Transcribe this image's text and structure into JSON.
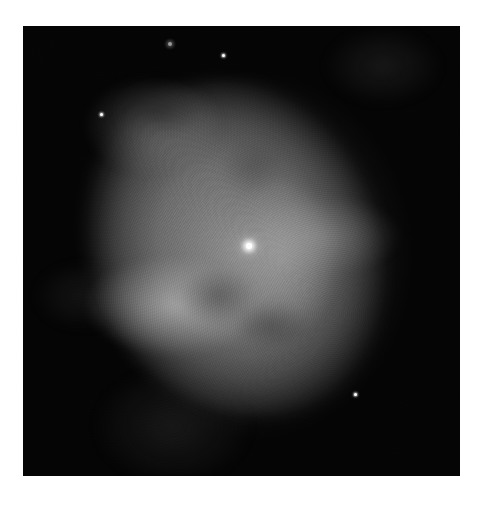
{
  "image": {
    "subject": "planetary nebula",
    "style": "grayscale astronomical photograph",
    "background_color": "#ffffff",
    "sky_color": "#050505",
    "frame": {
      "x": 23,
      "y": 26,
      "width": 437,
      "height": 450
    }
  },
  "stars": [
    {
      "name": "central-star",
      "x": 249,
      "y": 246,
      "type": "central"
    },
    {
      "name": "star-top-bright",
      "x": 223,
      "y": 55,
      "type": "small"
    },
    {
      "name": "star-top-faint",
      "x": 170,
      "y": 44,
      "type": "faint"
    },
    {
      "name": "star-upper-left",
      "x": 101,
      "y": 114,
      "type": "small"
    },
    {
      "name": "star-lower-right",
      "x": 355,
      "y": 394,
      "type": "small"
    }
  ]
}
